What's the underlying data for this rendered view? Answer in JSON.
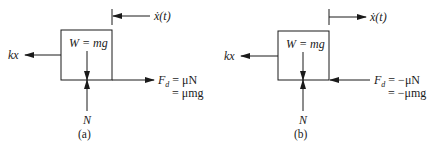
{
  "panels": [
    {
      "id": "a",
      "caption": "(a)",
      "weight_label": "W = mg",
      "spring_label": "kx",
      "normal_label": "N",
      "velocity_label": "ẋ(t)",
      "velocity_direction": "left",
      "friction_direction": "right",
      "friction_line1": "F",
      "friction_sub": "d",
      "friction_eq1": " = μN",
      "friction_eq2": "= μmg"
    },
    {
      "id": "b",
      "caption": "(b)",
      "weight_label": "W = mg",
      "spring_label": "kx",
      "normal_label": "N",
      "velocity_label": "ẋ(t)",
      "velocity_direction": "right",
      "friction_direction": "left",
      "friction_line1": "F",
      "friction_sub": "d",
      "friction_eq1": " = −μN",
      "friction_eq2": "= −μmg"
    }
  ],
  "colors": {
    "stroke": "#1a1a1a",
    "background": "#ffffff"
  }
}
